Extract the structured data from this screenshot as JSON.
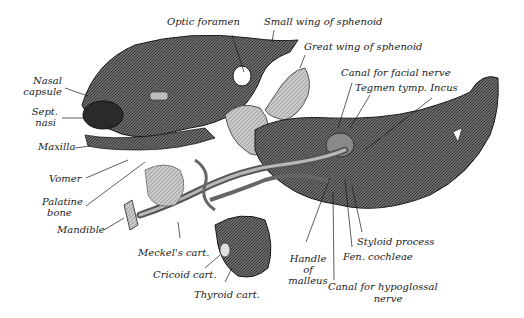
{
  "figure": {
    "colors": {
      "ink": "#1a1a1a",
      "mid": "#5a5a5a",
      "light": "#bdbdbd",
      "paper": "#ffffff"
    }
  },
  "labels": {
    "optic_foramen": "Optic foramen",
    "small_wing": "Small wing of sphenoid",
    "great_wing": "Great wing of sphenoid",
    "canal_facial": "Canal for facial nerve",
    "tegmen_incus": "Tegmen tymp. Incus",
    "nasal_capsule_1": "Nasal",
    "nasal_capsule_2": "capsule",
    "sept_nasi_1": "Sept.",
    "sept_nasi_2": "nasi",
    "maxilla": "Maxilla",
    "vomer": "Vomer",
    "palatine_1": "Palatine",
    "palatine_2": "bone",
    "mandible": "Mandible",
    "meckels": "Meckel's cart.",
    "cricoid": "Cricoid cart.",
    "thyroid": "Thyroid cart.",
    "handle_1": "Handle",
    "handle_2": "of",
    "handle_3": "malleus",
    "canal_hypo_1": "Canal for hypoglossal",
    "canal_hypo_2": "nerve",
    "styloid": "Styloid process",
    "fen_cochleae": "Fen. cochleae"
  }
}
